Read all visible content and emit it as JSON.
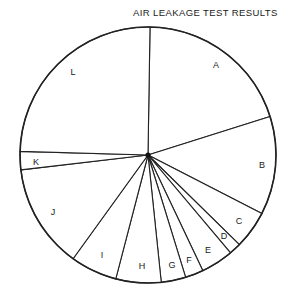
{
  "chart_data": {
    "type": "pie",
    "title": "AIR LEAKAGE TEST RESULTS",
    "start_angle_deg": 0.9,
    "direction": "clockwise",
    "categories": [
      "A",
      "B",
      "C",
      "D",
      "E",
      "F",
      "G",
      "H",
      "I",
      "J",
      "K",
      "L"
    ],
    "values": [
      19.9,
      12.4,
      4.8,
      1.5,
      4.1,
      2.3,
      3.1,
      5.7,
      5.9,
      13.2,
      2.3,
      24.8
    ],
    "unit": "percent (estimated from slice angles)",
    "legend": "none (labels inside slices)",
    "colors": {
      "fill": "#ffffff",
      "stroke": "#222222",
      "text": "#1a1a1a"
    },
    "geometry": {
      "cx": 148,
      "cy": 155,
      "r": 128
    },
    "label_positions": [
      {
        "label": "A",
        "x": 216,
        "y": 66
      },
      {
        "label": "B",
        "x": 262,
        "y": 166
      },
      {
        "label": "C",
        "x": 239,
        "y": 222
      },
      {
        "label": "D",
        "x": 224,
        "y": 237
      },
      {
        "label": "E",
        "x": 208,
        "y": 251
      },
      {
        "label": "F",
        "x": 189,
        "y": 261
      },
      {
        "label": "G",
        "x": 172,
        "y": 266
      },
      {
        "label": "H",
        "x": 142,
        "y": 267
      },
      {
        "label": "I",
        "x": 102,
        "y": 256
      },
      {
        "label": "J",
        "x": 53,
        "y": 213
      },
      {
        "label": "K",
        "x": 36,
        "y": 163
      },
      {
        "label": "L",
        "x": 73,
        "y": 73
      }
    ]
  }
}
